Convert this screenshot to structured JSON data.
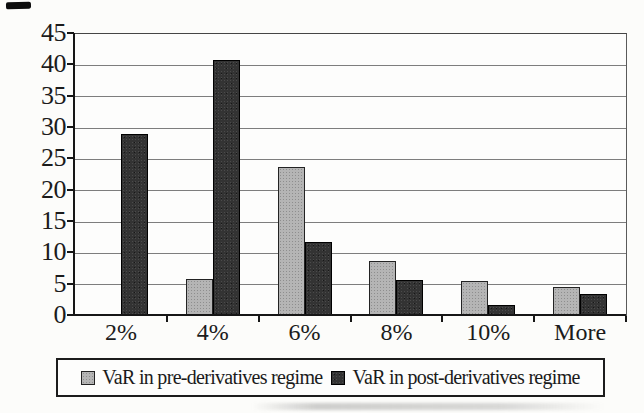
{
  "chart_data": {
    "type": "bar",
    "title": "",
    "categories": [
      "2%",
      "4%",
      "6%",
      "8%",
      "10%",
      "More"
    ],
    "series": [
      {
        "name": "VaR in pre-derivatives regime",
        "color": "#b5b5b5",
        "values": [
          0,
          5.9,
          23.7,
          8.7,
          5.6,
          4.6
        ]
      },
      {
        "name": "VaR in post-derivatives regime",
        "color": "#333333",
        "values": [
          29,
          40.8,
          11.8,
          5.8,
          1.8,
          3.5
        ]
      }
    ],
    "xlabel": "",
    "ylabel": "",
    "ylim": [
      0,
      45
    ],
    "yticks": [
      0,
      5,
      10,
      15,
      20,
      25,
      30,
      35,
      40,
      45
    ],
    "grid": "horizontal",
    "legend_position": "bottom",
    "axis_color": "#161616",
    "gridline_color": "#7d7d7d",
    "bar_style": "grouped"
  }
}
